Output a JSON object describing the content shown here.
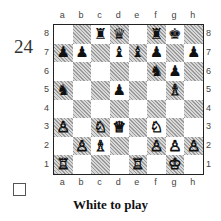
{
  "puzzle": {
    "number": "24",
    "caption": "White to play",
    "solved_checkbox": false
  },
  "board": {
    "files": [
      "a",
      "b",
      "c",
      "d",
      "e",
      "f",
      "g",
      "h"
    ],
    "ranks": [
      "8",
      "7",
      "6",
      "5",
      "4",
      "3",
      "2",
      "1"
    ],
    "pieces": {
      "c8": {
        "color": "black",
        "type": "rook",
        "glyph": "♜"
      },
      "d8": {
        "color": "black",
        "type": "queen",
        "glyph": "♛"
      },
      "f8": {
        "color": "black",
        "type": "rook",
        "glyph": "♜"
      },
      "g8": {
        "color": "black",
        "type": "king",
        "glyph": "♚"
      },
      "a7": {
        "color": "black",
        "type": "pawn",
        "glyph": "♟"
      },
      "b7": {
        "color": "black",
        "type": "pawn",
        "glyph": "♟"
      },
      "d7": {
        "color": "black",
        "type": "bishop",
        "glyph": "♝"
      },
      "e7": {
        "color": "black",
        "type": "bishop",
        "glyph": "♝"
      },
      "f7": {
        "color": "black",
        "type": "pawn",
        "glyph": "♟"
      },
      "h7": {
        "color": "black",
        "type": "pawn",
        "glyph": "♟"
      },
      "f6": {
        "color": "black",
        "type": "knight",
        "glyph": "♞"
      },
      "g6": {
        "color": "black",
        "type": "pawn",
        "glyph": "♟"
      },
      "a5": {
        "color": "black",
        "type": "knight",
        "glyph": "♞"
      },
      "d5": {
        "color": "black",
        "type": "pawn",
        "glyph": "♟"
      },
      "g5": {
        "color": "white",
        "type": "bishop",
        "glyph": "♗"
      },
      "a3": {
        "color": "white",
        "type": "pawn",
        "glyph": "♙"
      },
      "c3": {
        "color": "white",
        "type": "knight",
        "glyph": "♘"
      },
      "d3": {
        "color": "white",
        "type": "queen",
        "glyph": "♕"
      },
      "f3": {
        "color": "white",
        "type": "knight",
        "glyph": "♘"
      },
      "b2": {
        "color": "white",
        "type": "pawn",
        "glyph": "♙"
      },
      "c2": {
        "color": "white",
        "type": "bishop",
        "glyph": "♗"
      },
      "f2": {
        "color": "white",
        "type": "pawn",
        "glyph": "♙"
      },
      "g2": {
        "color": "white",
        "type": "pawn",
        "glyph": "♙"
      },
      "h2": {
        "color": "white",
        "type": "pawn",
        "glyph": "♙"
      },
      "a1": {
        "color": "white",
        "type": "rook",
        "glyph": "♖"
      },
      "e1": {
        "color": "white",
        "type": "rook",
        "glyph": "♖"
      },
      "g1": {
        "color": "white",
        "type": "king",
        "glyph": "♔"
      }
    }
  }
}
